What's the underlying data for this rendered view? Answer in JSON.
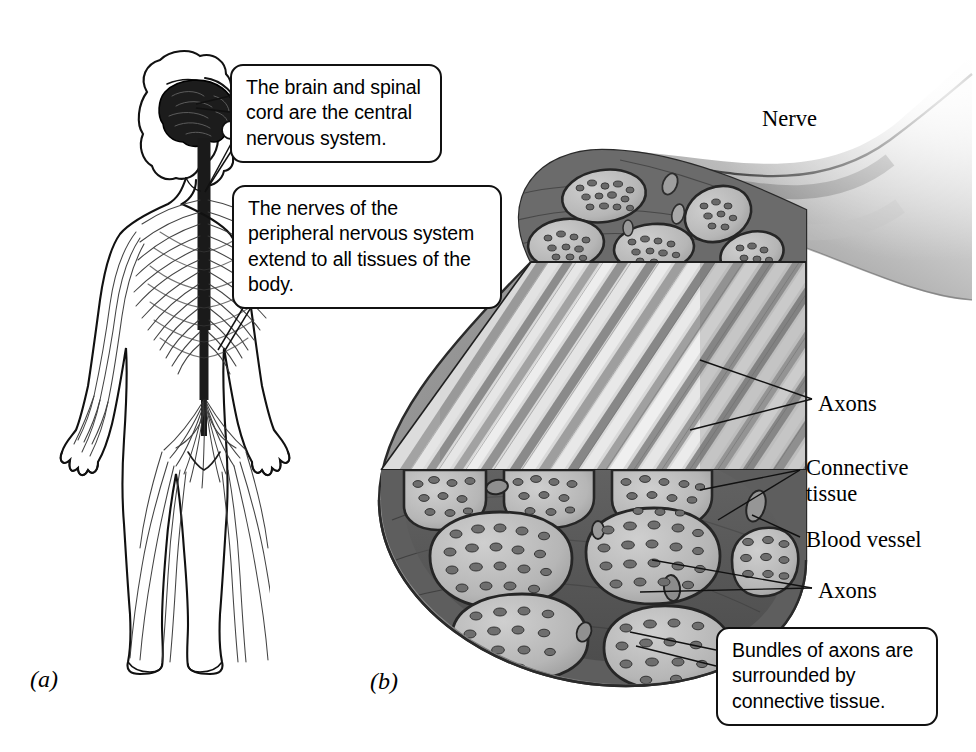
{
  "figure": {
    "panels": [
      {
        "id": "a",
        "letter": "(a)",
        "subject": "Human nervous system — whole body"
      },
      {
        "id": "b",
        "letter": "(b)",
        "subject": "Peripheral nerve cut-away"
      }
    ]
  },
  "callouts": [
    {
      "id": "cns",
      "text": "The brain and spinal cord are the central nervous system.",
      "points_to": "brain-and-spinal-cord"
    },
    {
      "id": "pns",
      "text": "The nerves of the peripheral nervous system extend to all tissues of the body.",
      "points_to": "peripheral-nerves"
    },
    {
      "id": "bundles",
      "text": "Bundles of axons are surrounded by connective tissue.",
      "points_to": "nerve-fascicle"
    }
  ],
  "labels": {
    "nerve": "Nerve",
    "axons_longitudinal": "Axons",
    "connective_tissue": "Connective tissue",
    "blood_vessel": "Blood vessel",
    "axons_cross_section": "Axons"
  },
  "colors": {
    "ink": "#111111",
    "page": "#ffffff",
    "epineurium": "#8e8e8e",
    "perineurium": "#4a4a4a",
    "fascicle_fill": "#bdbdbd",
    "axon_dot": "#6f6f6f",
    "fiber_light": "#d8d8d8",
    "fiber_dark": "#8a8a8a",
    "nerve_trunk": "#9a9a9a"
  }
}
